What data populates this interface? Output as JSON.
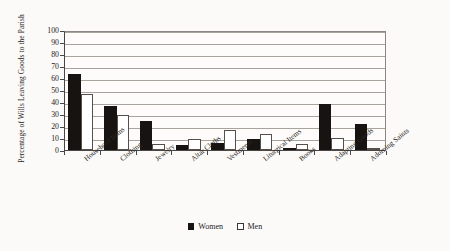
{
  "chart_data": {
    "type": "bar",
    "title": "",
    "subtitle": "",
    "xlabel": "",
    "ylabel": "Percentage of Wills Leaving Goods to the Parish",
    "ylim": [
      0,
      100
    ],
    "ytick_step": 10,
    "yticks": [
      100,
      90,
      80,
      70,
      60,
      50,
      40,
      30,
      20,
      10,
      0
    ],
    "grid": true,
    "grid_axis": "y",
    "legend_position": "bottom-center",
    "categories": [
      "Household Items",
      "Clothing",
      "Jewelry",
      "Altar Cloths",
      "Vestments",
      "Liturgical Items",
      "Books",
      "Adapting Goods",
      "Adorning Saints"
    ],
    "series": [
      {
        "name": "Women",
        "color": "#171310",
        "values": [
          63,
          37,
          24,
          4,
          6,
          9,
          0,
          38,
          22
        ]
      },
      {
        "name": "Men",
        "color": "#ffffff",
        "values": [
          47,
          29,
          5,
          9,
          17,
          13,
          5,
          10,
          1
        ]
      }
    ]
  },
  "legend": {
    "items": [
      {
        "label": "Women",
        "swatch": "filled-square-swatch"
      },
      {
        "label": "Men",
        "swatch": "outlined-square-swatch"
      }
    ]
  },
  "colors": {
    "women_fill": "#171310",
    "men_fill": "#ffffff",
    "bar_outline": "#55504c",
    "gridline": "#a9a39d",
    "axis": "#4a4643",
    "text": "#26221f",
    "page_background": "#fbfaf8",
    "plot_background": "#fdfcfa"
  }
}
